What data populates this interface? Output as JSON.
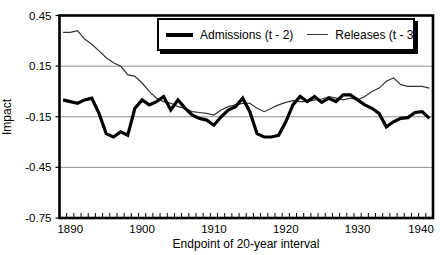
{
  "figure": {
    "background": "#ffffff",
    "axis_color": "#000000",
    "grid_color": "#909090",
    "admissions_color": "#000000",
    "releases_color": "#333333"
  },
  "chart_data": {
    "type": "line",
    "title": "",
    "xlabel": "Endpoint of 20-year interval",
    "ylabel": "Impact",
    "ylim": [
      -0.75,
      0.45
    ],
    "yticks": [
      0.45,
      0.15,
      -0.15,
      -0.45,
      -0.75
    ],
    "ytick_labels": [
      "0.45",
      "0.15",
      "-0.15",
      "-0.45",
      "-0.75"
    ],
    "gridlines": [
      0.15,
      -0.15,
      -0.45
    ],
    "grid": "horizontal-only",
    "legend_position": "top-right-inside",
    "xticks_labeled": [
      1890,
      1900,
      1910,
      1920,
      1930,
      1940
    ],
    "x": [
      1889,
      1890,
      1891,
      1892,
      1893,
      1894,
      1895,
      1896,
      1897,
      1898,
      1899,
      1900,
      1901,
      1902,
      1903,
      1904,
      1905,
      1906,
      1907,
      1908,
      1909,
      1910,
      1911,
      1912,
      1913,
      1914,
      1915,
      1916,
      1917,
      1918,
      1919,
      1920,
      1921,
      1922,
      1923,
      1924,
      1925,
      1926,
      1927,
      1928,
      1929,
      1930,
      1931,
      1932,
      1933,
      1934,
      1935,
      1936,
      1937,
      1938,
      1939,
      1940
    ],
    "series": [
      {
        "name": "Admissions (t - 2)",
        "stroke_width": 3.2,
        "values": [
          -0.05,
          -0.06,
          -0.07,
          -0.05,
          -0.04,
          -0.13,
          -0.25,
          -0.27,
          -0.24,
          -0.26,
          -0.1,
          -0.05,
          -0.08,
          -0.06,
          -0.03,
          -0.11,
          -0.05,
          -0.1,
          -0.14,
          -0.16,
          -0.17,
          -0.2,
          -0.15,
          -0.11,
          -0.09,
          -0.04,
          -0.12,
          -0.25,
          -0.27,
          -0.27,
          -0.26,
          -0.18,
          -0.08,
          -0.03,
          -0.06,
          -0.03,
          -0.065,
          -0.04,
          -0.06,
          -0.02,
          -0.02,
          -0.05,
          -0.08,
          -0.1,
          -0.13,
          -0.21,
          -0.18,
          -0.16,
          -0.155,
          -0.125,
          -0.12,
          -0.16
        ]
      },
      {
        "name": "Releases (t - 3)",
        "stroke_width": 1.2,
        "values": [
          0.35,
          0.35,
          0.36,
          0.31,
          0.28,
          0.24,
          0.2,
          0.17,
          0.15,
          0.1,
          0.09,
          0.05,
          0.0,
          -0.04,
          -0.06,
          -0.07,
          -0.09,
          -0.1,
          -0.12,
          -0.125,
          -0.13,
          -0.14,
          -0.11,
          -0.09,
          -0.08,
          -0.07,
          -0.07,
          -0.1,
          -0.12,
          -0.1,
          -0.08,
          -0.065,
          -0.055,
          -0.06,
          -0.06,
          -0.05,
          -0.045,
          -0.03,
          -0.04,
          -0.05,
          -0.04,
          -0.05,
          -0.03,
          0.0,
          0.02,
          0.06,
          0.08,
          0.04,
          0.03,
          0.03,
          0.03,
          0.02
        ]
      }
    ]
  }
}
